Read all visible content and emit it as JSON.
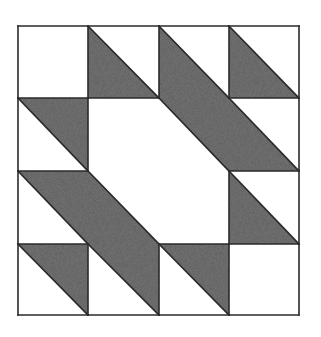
{
  "diagram": {
    "type": "quilt-block",
    "grid": {
      "rows": 4,
      "cols": 4
    },
    "origin": {
      "x": 18,
      "y": 26
    },
    "col_edges": [
      18,
      88,
      159,
      229,
      299
    ],
    "row_edges": [
      26,
      98,
      171,
      244,
      315
    ],
    "colors": {
      "fill": "#5a5a5a",
      "background": "#ffffff",
      "stroke": "#2a2a2a"
    },
    "legend": {
      "W": "white square",
      "L": "gray lower-left triangle",
      "U": "gray upper-right triangle"
    },
    "cells": [
      [
        "W",
        "L",
        "L",
        "L"
      ],
      [
        "U",
        "W",
        "U",
        "L"
      ],
      [
        "U",
        "L",
        "W",
        "L"
      ],
      [
        "U",
        "U",
        "U",
        "W"
      ]
    ]
  }
}
